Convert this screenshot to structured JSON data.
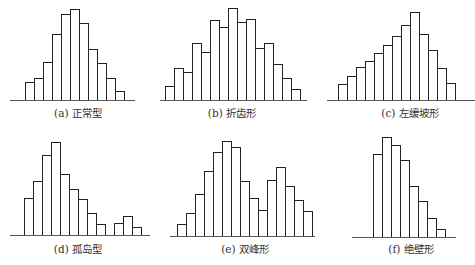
{
  "chart_data": [
    {
      "type": "bar",
      "title": "(a) 正常型",
      "caption": "(a) 正常型",
      "values": [
        18,
        22,
        38,
        66,
        86,
        91,
        77,
        51,
        37,
        22,
        9
      ],
      "layout": {
        "baseline_y": 100,
        "axis_x0": 10,
        "axis_x1": 135,
        "bar_x0": 25,
        "bar_w": 9,
        "caption_x": 78,
        "caption_y": 105
      }
    },
    {
      "type": "bar",
      "title": "(b) 折齿形",
      "caption": "(b) 折齿形",
      "values": [
        14,
        32,
        28,
        57,
        48,
        80,
        73,
        92,
        78,
        81,
        52,
        57,
        36,
        22,
        11
      ],
      "layout": {
        "baseline_y": 100,
        "axis_x0": 160,
        "axis_x1": 307,
        "bar_x0": 165,
        "bar_w": 9,
        "caption_x": 232,
        "caption_y": 105
      }
    },
    {
      "type": "bar",
      "title": "(c) 左缓坡形",
      "caption": "(c) 左缓坡形",
      "values": [
        16,
        24,
        33,
        39,
        47,
        55,
        64,
        75,
        88,
        66,
        50,
        32,
        17
      ],
      "layout": {
        "baseline_y": 100,
        "axis_x0": 327,
        "axis_x1": 475,
        "bar_x0": 338,
        "bar_w": 9,
        "caption_x": 410,
        "caption_y": 105
      }
    },
    {
      "type": "bar",
      "title": "(d) 孤岛型",
      "caption": "(d) 孤岛型",
      "values": [
        37,
        54,
        80,
        93,
        61,
        46,
        36,
        22,
        11,
        0,
        12,
        19,
        8
      ],
      "layout": {
        "baseline_y": 235,
        "axis_x0": 10,
        "axis_x1": 150,
        "bar_x0": 24,
        "bar_w": 9,
        "caption_x": 78,
        "caption_y": 241
      }
    },
    {
      "type": "bar",
      "title": "(e) 双峰形",
      "caption": "(e) 双峰形",
      "values": [
        12,
        23,
        42,
        65,
        84,
        95,
        89,
        55,
        38,
        26,
        56,
        69,
        50,
        36,
        25
      ],
      "layout": {
        "baseline_y": 236,
        "axis_x0": 170,
        "axis_x1": 315,
        "bar_x0": 177,
        "bar_w": 9,
        "caption_x": 245,
        "caption_y": 241
      }
    },
    {
      "type": "bar",
      "title": "(f) 绝壁形",
      "caption": "(f) 绝壁形",
      "values": [
        83,
        100,
        92,
        77,
        51,
        36,
        19,
        8
      ],
      "layout": {
        "baseline_y": 237,
        "axis_x0": 352,
        "axis_x1": 456,
        "bar_x0": 373,
        "bar_w": 9,
        "caption_x": 411,
        "caption_y": 241
      }
    }
  ],
  "style": {
    "stroke": "#222222",
    "fill": "#ffffff",
    "axis": "#555555"
  }
}
